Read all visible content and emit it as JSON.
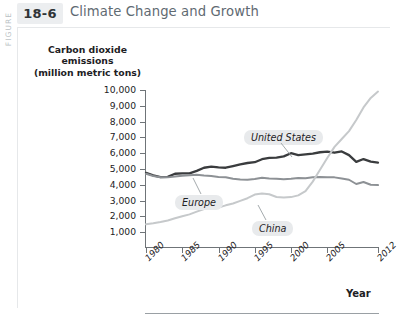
{
  "figure": {
    "kicker": "FIGURE",
    "number": "18-6",
    "title": "Climate Change and Growth"
  },
  "colors": {
    "united_states": "#3a3c3e",
    "europe": "#8d9195",
    "china": "#c6c9cb",
    "axis": "#6f7478",
    "title_text": "#5f6a72",
    "label_chip": "#e8eaec",
    "fig_num_chip": "#eceef0"
  },
  "chart_data": {
    "type": "line",
    "title": "Climate Change and Growth",
    "xlabel": "Year",
    "ylabel": "Carbon dioxide emissions (million metric tons)",
    "ylabel_lines": [
      "Carbon dioxide",
      "emissions",
      "(million metric tons)"
    ],
    "xlim": [
      1980,
      2012
    ],
    "ylim": [
      0,
      10000
    ],
    "ytick_labels": [
      "10,000",
      "9,000",
      "8,000",
      "7,000",
      "6,000",
      "5,000",
      "4,000",
      "3,000",
      "2,000",
      "1,000"
    ],
    "ytick_values": [
      10000,
      9000,
      8000,
      7000,
      6000,
      5000,
      4000,
      3000,
      2000,
      1000
    ],
    "xtick_labels": [
      "1980",
      "1985",
      "1990",
      "1995",
      "2000",
      "2005",
      "2012"
    ],
    "xtick_values": [
      1980,
      1985,
      1990,
      1995,
      2000,
      2005,
      2012
    ],
    "grid": false,
    "legend": "inline-labels",
    "x": [
      1980,
      1981,
      1982,
      1983,
      1984,
      1985,
      1986,
      1987,
      1988,
      1989,
      1990,
      1991,
      1992,
      1993,
      1994,
      1995,
      1996,
      1997,
      1998,
      1999,
      2000,
      2001,
      2002,
      2003,
      2004,
      2005,
      2006,
      2007,
      2008,
      2009,
      2010,
      2011,
      2012
    ],
    "series": [
      {
        "name": "United States",
        "color": "#3a3c3e",
        "values": [
          4750,
          4600,
          4480,
          4500,
          4700,
          4720,
          4720,
          4880,
          5080,
          5150,
          5100,
          5080,
          5180,
          5290,
          5380,
          5430,
          5620,
          5700,
          5720,
          5800,
          6000,
          5880,
          5920,
          5970,
          6060,
          6100,
          6030,
          6110,
          5880,
          5450,
          5630,
          5470,
          5400
        ]
      },
      {
        "name": "Europe",
        "color": "#8d9195",
        "values": [
          4700,
          4560,
          4480,
          4470,
          4520,
          4580,
          4600,
          4640,
          4590,
          4560,
          4500,
          4480,
          4380,
          4330,
          4320,
          4360,
          4440,
          4400,
          4390,
          4350,
          4380,
          4430,
          4420,
          4480,
          4490,
          4480,
          4470,
          4400,
          4320,
          4050,
          4180,
          4000,
          3980
        ]
      },
      {
        "name": "China",
        "color": "#c6c9cb",
        "values": [
          1500,
          1560,
          1640,
          1740,
          1880,
          2010,
          2130,
          2300,
          2460,
          2540,
          2560,
          2700,
          2820,
          2980,
          3150,
          3380,
          3450,
          3400,
          3230,
          3200,
          3220,
          3330,
          3600,
          4200,
          4950,
          5700,
          6400,
          6900,
          7400,
          8100,
          8900,
          9500,
          9900
        ]
      }
    ],
    "annotations": [
      {
        "text": "United States",
        "series": "United States"
      },
      {
        "text": "Europe",
        "series": "Europe"
      },
      {
        "text": "China",
        "series": "China"
      }
    ]
  }
}
